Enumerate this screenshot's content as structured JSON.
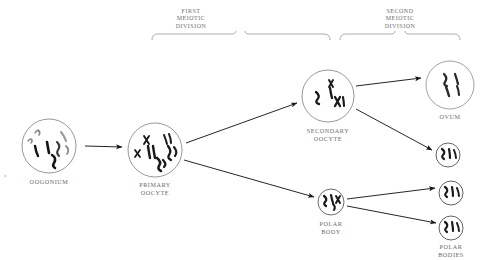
{
  "diagram": {
    "colors": {
      "background": "#ffffff",
      "text": "#6b6b6b",
      "stroke_dark": "#1a1a1a",
      "stroke_light": "#8a8a8a",
      "chromosome_dark": "#111111",
      "chromosome_gray": "#8d8d8d"
    },
    "brackets": [
      {
        "id": "first-meiotic-division",
        "label_lines": [
          "FIRST",
          "MEIOTIC",
          "DIVISION"
        ],
        "x_start": 152,
        "x_end": 330,
        "y": 32
      },
      {
        "id": "second-meiotic-division",
        "label_lines": [
          "SECOND",
          "MEIOTIC",
          "DIVISION"
        ],
        "x_start": 340,
        "x_end": 460,
        "y": 32
      }
    ],
    "cells": [
      {
        "id": "oogonium",
        "label_lines": [
          "OOGONIUM"
        ],
        "cx": 49,
        "cy": 146,
        "r": 27,
        "size": "large",
        "label_x": 49,
        "label_y": 178
      },
      {
        "id": "primary-oocyte",
        "label_lines": [
          "PRIMARY",
          "OOCYTE"
        ],
        "cx": 155,
        "cy": 150,
        "r": 27,
        "size": "large",
        "label_x": 155,
        "label_y": 181
      },
      {
        "id": "secondary-oocyte",
        "label_lines": [
          "SECONDARY",
          "OOCYTE"
        ],
        "cx": 328,
        "cy": 96,
        "r": 26,
        "size": "large",
        "label_x": 328,
        "label_y": 127
      },
      {
        "id": "polar-body",
        "label_lines": [
          "POLAR",
          "BODY"
        ],
        "cx": 331,
        "cy": 202,
        "r": 13,
        "size": "small",
        "label_x": 331,
        "label_y": 220
      },
      {
        "id": "ovum",
        "label_lines": [
          "OVUM"
        ],
        "cx": 450,
        "cy": 85,
        "r": 24,
        "size": "large",
        "label_x": 450,
        "label_y": 113
      },
      {
        "id": "polar-body-upper",
        "label_lines": [],
        "cx": 448,
        "cy": 155,
        "r": 12,
        "size": "small",
        "label_x": 448,
        "label_y": 171
      },
      {
        "id": "polar-body-middle",
        "label_lines": [],
        "cx": 451,
        "cy": 193,
        "r": 12,
        "size": "small",
        "label_x": 451,
        "label_y": 209
      },
      {
        "id": "polar-bodies",
        "label_lines": [
          "POLAR",
          "BODIES"
        ],
        "cx": 451,
        "cy": 228,
        "r": 12,
        "size": "small",
        "label_x": 451,
        "label_y": 243
      }
    ],
    "arrows": [
      {
        "id": "oogonium-to-primary-oocyte",
        "x1": 85,
        "y1": 146,
        "x2": 122,
        "y2": 147
      },
      {
        "id": "primary-to-secondary-oocyte",
        "x1": 186,
        "y1": 143,
        "x2": 297,
        "y2": 103
      },
      {
        "id": "primary-to-polar-body",
        "x1": 184,
        "y1": 160,
        "x2": 314,
        "y2": 197
      },
      {
        "id": "secondary-to-ovum",
        "x1": 356,
        "y1": 86,
        "x2": 421,
        "y2": 78
      },
      {
        "id": "secondary-to-polar-body-upper",
        "x1": 356,
        "y1": 109,
        "x2": 432,
        "y2": 150
      },
      {
        "id": "polar-body-to-polar-body-middle",
        "x1": 347,
        "y1": 199,
        "x2": 435,
        "y2": 188
      },
      {
        "id": "polar-body-to-polar-bodies",
        "x1": 347,
        "y1": 206,
        "x2": 436,
        "y2": 223
      }
    ]
  }
}
